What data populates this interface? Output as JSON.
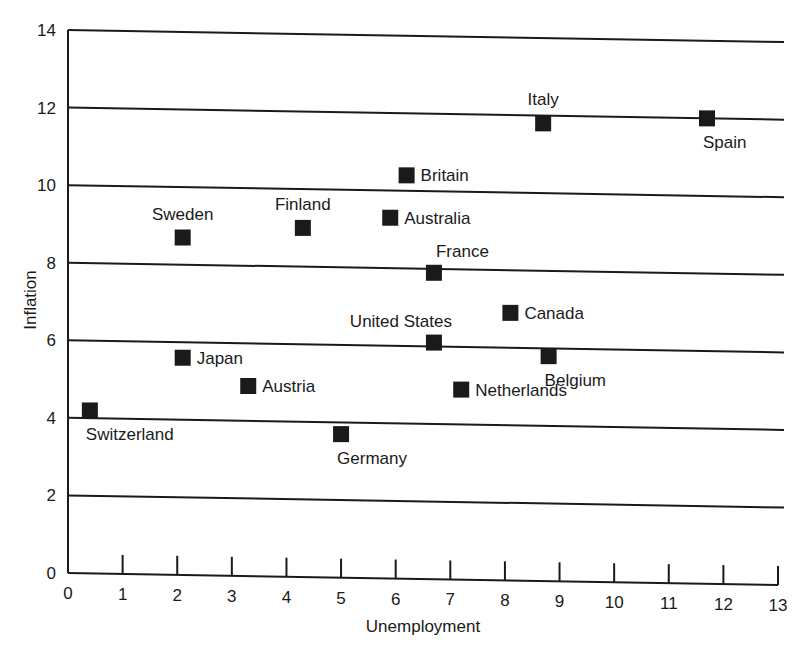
{
  "chart_data": {
    "type": "scatter",
    "title": "",
    "xlabel": "Unemployment",
    "ylabel": "Inflation",
    "xlim": [
      0,
      13
    ],
    "ylim": [
      0,
      14
    ],
    "x_ticks": [
      0,
      1,
      2,
      3,
      4,
      5,
      6,
      7,
      8,
      9,
      10,
      11,
      12,
      13
    ],
    "y_ticks": [
      0,
      2,
      4,
      6,
      8,
      10,
      12,
      14
    ],
    "grid": "horizontal",
    "legend": "none",
    "marker": "filled-square",
    "points": [
      {
        "label": "Switzerland",
        "x": 0.4,
        "y": 4.2,
        "label_pos": "below-right"
      },
      {
        "label": "Japan",
        "x": 2.1,
        "y": 5.6,
        "label_pos": "right"
      },
      {
        "label": "Austria",
        "x": 3.3,
        "y": 4.9,
        "label_pos": "right"
      },
      {
        "label": "Sweden",
        "x": 2.1,
        "y": 8.7,
        "label_pos": "above"
      },
      {
        "label": "Finland",
        "x": 4.3,
        "y": 9.0,
        "label_pos": "above"
      },
      {
        "label": "Germany",
        "x": 5.0,
        "y": 3.7,
        "label_pos": "below-right"
      },
      {
        "label": "Britain",
        "x": 6.2,
        "y": 10.4,
        "label_pos": "right"
      },
      {
        "label": "Australia",
        "x": 5.9,
        "y": 9.3,
        "label_pos": "right"
      },
      {
        "label": "France",
        "x": 6.7,
        "y": 7.9,
        "label_pos": "above-right"
      },
      {
        "label": "United States",
        "x": 6.7,
        "y": 6.1,
        "label_pos": "above-left"
      },
      {
        "label": "Netherlands",
        "x": 7.2,
        "y": 4.9,
        "label_pos": "right"
      },
      {
        "label": "Canada",
        "x": 8.1,
        "y": 6.9,
        "label_pos": "right"
      },
      {
        "label": "Belgium",
        "x": 8.8,
        "y": 5.8,
        "label_pos": "below-right"
      },
      {
        "label": "Italy",
        "x": 8.7,
        "y": 11.8,
        "label_pos": "above"
      },
      {
        "label": "Spain",
        "x": 11.7,
        "y": 12.0,
        "label_pos": "below-right"
      }
    ],
    "colors": {
      "ink": "#1a1a1a",
      "background": "#ffffff"
    }
  }
}
